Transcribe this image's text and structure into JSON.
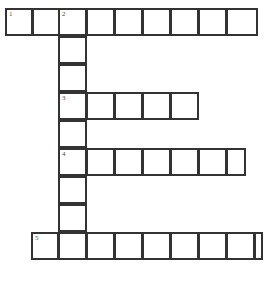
{
  "puzzle": {
    "title": "Crossword Puzzle Grid",
    "type": "crossword-grid",
    "background_color": "#ffffff",
    "cell_fill_color": "#ffffff",
    "cell_border_color": "#333333",
    "number_color": "#4a4a4a",
    "grid": {
      "origin_x": 5,
      "origin_y": 8,
      "cell_width": 28.3,
      "cell_height": 28,
      "columns": 9,
      "rows": 9
    },
    "clue_numbers": [
      "1",
      "2",
      "3",
      "4",
      "5"
    ],
    "entries": [
      {
        "number": "1",
        "direction": "across",
        "row": 0,
        "col": 0,
        "length": 9,
        "cells": [
          "",
          "",
          "",
          "",
          "",
          "",
          "",
          "",
          ""
        ]
      },
      {
        "number": "2",
        "direction": "down",
        "row": 0,
        "col": 2,
        "length": 9,
        "cells": [
          "",
          "",
          "",
          "",
          "",
          "",
          "",
          "",
          ""
        ]
      },
      {
        "number": "3",
        "direction": "across",
        "row": 3,
        "col": 2,
        "length": 5,
        "cells": [
          "",
          "",
          "",
          "",
          ""
        ]
      },
      {
        "number": "4",
        "direction": "across",
        "row": 5,
        "col": 2,
        "length": 7,
        "cells": [
          "",
          "",
          "",
          "",
          "",
          "",
          ""
        ]
      },
      {
        "number": "5",
        "direction": "across",
        "row": 8,
        "col": 1,
        "length": 9,
        "cells": [
          "",
          "",
          "",
          "",
          "",
          "",
          "",
          "",
          ""
        ]
      }
    ],
    "cells": [
      {
        "name": "cell-r0c0",
        "x": 5,
        "y": 8,
        "w": 28,
        "h": 28,
        "number": "1",
        "value": ""
      },
      {
        "name": "cell-r0c1",
        "x": 32,
        "y": 8,
        "w": 28,
        "h": 28,
        "number": "",
        "value": ""
      },
      {
        "name": "cell-r0c2",
        "x": 58,
        "y": 8,
        "w": 29,
        "h": 28,
        "number": "2",
        "value": ""
      },
      {
        "name": "cell-r0c3",
        "x": 86,
        "y": 8,
        "w": 29,
        "h": 28,
        "number": "",
        "value": ""
      },
      {
        "name": "cell-r0c4",
        "x": 114,
        "y": 8,
        "w": 29,
        "h": 28,
        "number": "",
        "value": ""
      },
      {
        "name": "cell-r0c5",
        "x": 142,
        "y": 8,
        "w": 29,
        "h": 28,
        "number": "",
        "value": ""
      },
      {
        "name": "cell-r0c6",
        "x": 170,
        "y": 8,
        "w": 29,
        "h": 28,
        "number": "",
        "value": ""
      },
      {
        "name": "cell-r0c7",
        "x": 198,
        "y": 8,
        "w": 29,
        "h": 28,
        "number": "",
        "value": ""
      },
      {
        "name": "cell-r0c8",
        "x": 226,
        "y": 8,
        "w": 32,
        "h": 28,
        "number": "",
        "value": ""
      },
      {
        "name": "cell-r1c2",
        "x": 58,
        "y": 36,
        "w": 29,
        "h": 28,
        "number": "",
        "value": ""
      },
      {
        "name": "cell-r2c2",
        "x": 58,
        "y": 64,
        "w": 29,
        "h": 28,
        "number": "",
        "value": ""
      },
      {
        "name": "cell-r3c2",
        "x": 58,
        "y": 92,
        "w": 29,
        "h": 28,
        "number": "3",
        "value": ""
      },
      {
        "name": "cell-r3c3",
        "x": 86,
        "y": 92,
        "w": 29,
        "h": 28,
        "number": "",
        "value": ""
      },
      {
        "name": "cell-r3c4",
        "x": 114,
        "y": 92,
        "w": 29,
        "h": 28,
        "number": "",
        "value": ""
      },
      {
        "name": "cell-r3c5",
        "x": 142,
        "y": 92,
        "w": 29,
        "h": 28,
        "number": "",
        "value": ""
      },
      {
        "name": "cell-r3c6",
        "x": 170,
        "y": 92,
        "w": 29,
        "h": 28,
        "number": "",
        "value": ""
      },
      {
        "name": "cell-r4c2",
        "x": 58,
        "y": 120,
        "w": 29,
        "h": 28,
        "number": "",
        "value": ""
      },
      {
        "name": "cell-r5c2",
        "x": 58,
        "y": 148,
        "w": 29,
        "h": 28,
        "number": "4",
        "value": ""
      },
      {
        "name": "cell-r5c3",
        "x": 86,
        "y": 148,
        "w": 29,
        "h": 28,
        "number": "",
        "value": ""
      },
      {
        "name": "cell-r5c4",
        "x": 114,
        "y": 148,
        "w": 29,
        "h": 28,
        "number": "",
        "value": ""
      },
      {
        "name": "cell-r5c5",
        "x": 142,
        "y": 148,
        "w": 29,
        "h": 28,
        "number": "",
        "value": ""
      },
      {
        "name": "cell-r5c6",
        "x": 170,
        "y": 148,
        "w": 29,
        "h": 28,
        "number": "",
        "value": ""
      },
      {
        "name": "cell-r5c7",
        "x": 198,
        "y": 148,
        "w": 29,
        "h": 28,
        "number": "",
        "value": ""
      },
      {
        "name": "cell-r5c8",
        "x": 226,
        "y": 148,
        "w": 20,
        "h": 28,
        "number": "",
        "value": ""
      },
      {
        "name": "cell-r6c2",
        "x": 58,
        "y": 176,
        "w": 29,
        "h": 28,
        "number": "",
        "value": ""
      },
      {
        "name": "cell-r7c2",
        "x": 58,
        "y": 204,
        "w": 29,
        "h": 28,
        "number": "",
        "value": ""
      },
      {
        "name": "cell-r8c1",
        "x": 31,
        "y": 232,
        "w": 28,
        "h": 28,
        "number": "5",
        "value": ""
      },
      {
        "name": "cell-r8c2",
        "x": 58,
        "y": 232,
        "w": 29,
        "h": 28,
        "number": "",
        "value": ""
      },
      {
        "name": "cell-r8c3",
        "x": 86,
        "y": 232,
        "w": 29,
        "h": 28,
        "number": "",
        "value": ""
      },
      {
        "name": "cell-r8c4",
        "x": 114,
        "y": 232,
        "w": 29,
        "h": 28,
        "number": "",
        "value": ""
      },
      {
        "name": "cell-r8c5",
        "x": 142,
        "y": 232,
        "w": 29,
        "h": 28,
        "number": "",
        "value": ""
      },
      {
        "name": "cell-r8c6",
        "x": 170,
        "y": 232,
        "w": 29,
        "h": 28,
        "number": "",
        "value": ""
      },
      {
        "name": "cell-r8c7",
        "x": 198,
        "y": 232,
        "w": 29,
        "h": 28,
        "number": "",
        "value": ""
      },
      {
        "name": "cell-r8c8",
        "x": 226,
        "y": 232,
        "w": 29,
        "h": 28,
        "number": "",
        "value": ""
      },
      {
        "name": "cell-r8c9",
        "x": 254,
        "y": 232,
        "w": 9,
        "h": 28,
        "number": "",
        "value": ""
      }
    ]
  }
}
